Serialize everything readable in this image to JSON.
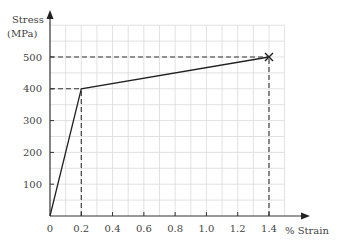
{
  "chart_data": {
    "type": "line",
    "title": "",
    "xlabel": "% Strain",
    "ylabel_line1": "Stress",
    "ylabel_line2": "(MPa)",
    "xlim": [
      0,
      1.5
    ],
    "ylim": [
      0,
      600
    ],
    "grid": true,
    "x_ticks": [
      "0",
      "0.2",
      "0.4",
      "0.6",
      "0.8",
      "1.0",
      "1.2",
      "1.4"
    ],
    "y_ticks": [
      "100",
      "200",
      "300",
      "400",
      "500"
    ],
    "series": [
      {
        "name": "stress-strain",
        "x": [
          0,
          0.2,
          1.4
        ],
        "y": [
          0,
          400,
          500
        ]
      }
    ],
    "annotations": [
      {
        "type": "dashed-guide",
        "from": [
          0,
          400
        ],
        "to": [
          0.2,
          400
        ]
      },
      {
        "type": "dashed-guide",
        "from": [
          0.2,
          0
        ],
        "to": [
          0.2,
          400
        ]
      },
      {
        "type": "dashed-guide",
        "from": [
          0,
          500
        ],
        "to": [
          1.4,
          500
        ]
      },
      {
        "type": "dashed-guide",
        "from": [
          1.4,
          0
        ],
        "to": [
          1.4,
          500
        ]
      },
      {
        "type": "marker-x",
        "at": [
          1.4,
          500
        ],
        "label": "fracture"
      }
    ]
  }
}
